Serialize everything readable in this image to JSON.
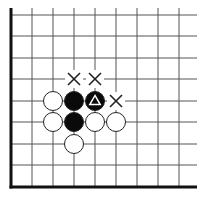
{
  "diagram": {
    "type": "go-board-fragment",
    "corner": "bottom-left",
    "grid": {
      "columns_x": [
        11,
        32,
        53,
        74,
        95,
        116,
        137,
        158,
        179
      ],
      "rows_y": [
        15,
        36,
        58,
        79,
        101,
        122,
        144,
        165,
        187
      ],
      "edge_left_x": 11,
      "edge_bottom_y": 187,
      "extend_right_x": 197,
      "extend_top_y": 8,
      "line_color": "#555555",
      "edge_color": "#111111"
    },
    "stones": [
      {
        "color": "white",
        "col": 2,
        "row": 4
      },
      {
        "color": "black",
        "col": 3,
        "row": 4
      },
      {
        "color": "black",
        "col": 4,
        "row": 4,
        "mark": "triangle"
      },
      {
        "color": "white",
        "col": 2,
        "row": 5
      },
      {
        "color": "black",
        "col": 3,
        "row": 5
      },
      {
        "color": "white",
        "col": 4,
        "row": 5
      },
      {
        "color": "white",
        "col": 5,
        "row": 5
      },
      {
        "color": "white",
        "col": 3,
        "row": 6
      }
    ],
    "markers": [
      {
        "type": "x",
        "col": 3,
        "row": 3
      },
      {
        "type": "x",
        "col": 4,
        "row": 3
      },
      {
        "type": "x",
        "col": 5,
        "row": 4
      }
    ],
    "colors": {
      "black_stone": "#0a0a0a",
      "white_stone": "#ffffff",
      "stone_outline": "#222222",
      "marker": "#222222",
      "triangle_on_black": "#ffffff"
    }
  }
}
